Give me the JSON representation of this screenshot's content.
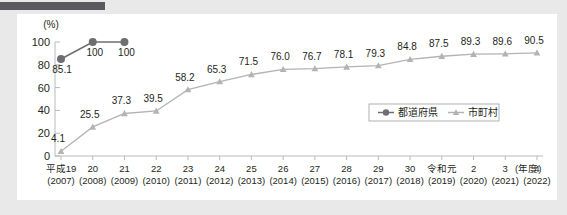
{
  "page": {
    "background_color": "#e9e9e9",
    "card_color": "#ffffff",
    "top_bar_color": "#5a5a5e"
  },
  "chart_data": {
    "type": "line",
    "title": "",
    "subtitle": "",
    "xlabel": "(年度)",
    "ylabel": "(%)",
    "ylim": [
      0,
      100
    ],
    "yticks": [
      0,
      20,
      40,
      60,
      80,
      100
    ],
    "ytick_labels": [
      "0",
      "20",
      "40",
      "60",
      "80",
      "100"
    ],
    "grid": false,
    "legend_position": "inside-bottom-right",
    "categories": [
      "平成19",
      "20",
      "21",
      "22",
      "23",
      "24",
      "25",
      "26",
      "27",
      "28",
      "29",
      "30",
      "令和元",
      "2",
      "3",
      "4"
    ],
    "category_sublabels": [
      "(2007)",
      "(2008)",
      "(2009)",
      "(2010)",
      "(2011)",
      "(2012)",
      "(2013)",
      "(2014)",
      "(2015)",
      "(2016)",
      "(2017)",
      "(2018)",
      "(2019)",
      "(2020)",
      "(2021)",
      "(2022)"
    ],
    "series": [
      {
        "name": "都道府県",
        "color": "#6e6e72",
        "marker": "circle",
        "values": [
          85.1,
          100,
          100,
          null,
          null,
          null,
          null,
          null,
          null,
          null,
          null,
          null,
          null,
          null,
          null,
          null
        ],
        "data_labels": [
          "85.1",
          "100",
          "100",
          "",
          "",
          "",
          "",
          "",
          "",
          "",
          "",
          "",
          "",
          "",
          "",
          ""
        ]
      },
      {
        "name": "市町村",
        "color": "#b3b3b3",
        "marker": "triangle",
        "values": [
          4.1,
          25.5,
          37.3,
          39.5,
          58.2,
          65.3,
          71.5,
          76.0,
          76.7,
          78.1,
          79.3,
          84.8,
          87.5,
          89.3,
          89.6,
          90.5
        ],
        "data_labels": [
          "4.1",
          "25.5",
          "37.3",
          "39.5",
          "58.2",
          "65.3",
          "71.5",
          "76.0",
          "76.7",
          "78.1",
          "79.3",
          "84.8",
          "87.5",
          "89.3",
          "89.6",
          "90.5"
        ]
      }
    ],
    "legend": [
      {
        "label": "都道府県",
        "color": "#6e6e72",
        "marker": "circle"
      },
      {
        "label": "市町村",
        "color": "#b3b3b3",
        "marker": "triangle"
      }
    ]
  }
}
